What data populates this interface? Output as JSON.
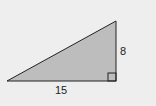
{
  "diagram": {
    "type": "right-triangle",
    "labels": {
      "height": "8",
      "base": "15"
    },
    "colors": {
      "background": "#eeeeee",
      "fill": "#bdbdbd",
      "stroke": "#222222"
    },
    "right_angle_marker": true
  }
}
